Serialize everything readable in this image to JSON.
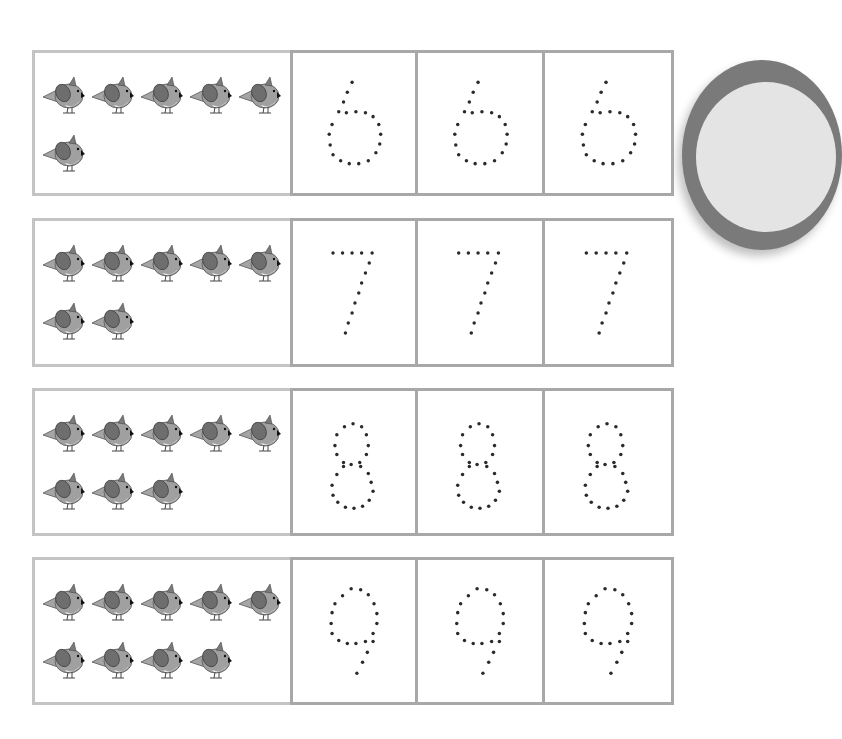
{
  "worksheet": {
    "rows": [
      {
        "number": "6",
        "bird_count": 6,
        "trace_cells": 3
      },
      {
        "number": "7",
        "bird_count": 7,
        "trace_cells": 3
      },
      {
        "number": "8",
        "bird_count": 8,
        "trace_cells": 3
      },
      {
        "number": "9",
        "bird_count": 9,
        "trace_cells": 3
      }
    ]
  },
  "colors": {
    "bird_body": "#9a9a9a",
    "bird_wing": "#6e6e6e",
    "dot": "#2a2a2a",
    "border": "#a8a8a8"
  },
  "icons": {
    "counter": "bird-icon",
    "tracing": "dotted-digit"
  }
}
